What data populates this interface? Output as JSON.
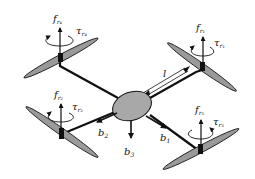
{
  "diagram": {
    "rotors": [
      {
        "id": "r1",
        "force_label": "f",
        "force_sub": "r₁",
        "torque_label": "τ",
        "torque_sub": "r₁"
      },
      {
        "id": "r2",
        "force_label": "f",
        "force_sub": "r₂",
        "torque_label": "τ",
        "torque_sub": "r₂"
      },
      {
        "id": "r3",
        "force_label": "f",
        "force_sub": "r₃",
        "torque_label": "τ",
        "torque_sub": "r₃"
      },
      {
        "id": "r4",
        "force_label": "f",
        "force_sub": "r₄",
        "torque_label": "τ",
        "torque_sub": "r₄"
      }
    ],
    "axes": [
      {
        "label": "b",
        "sub": "1"
      },
      {
        "label": "b",
        "sub": "2"
      },
      {
        "label": "b",
        "sub": "3"
      }
    ],
    "arm_length_label": "l",
    "colors": {
      "propeller_fill": "#9a9a9a",
      "body_fill": "#a8a8a8",
      "stroke": "#111111"
    }
  }
}
